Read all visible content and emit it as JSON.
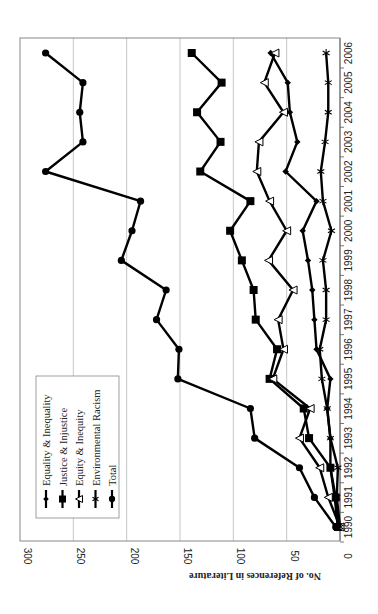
{
  "chart_data": {
    "type": "line",
    "orientation": "rotated-90-clockwise",
    "title": "",
    "xlabel": "",
    "ylabel": "No. of References in Literature",
    "ylim": [
      0,
      300
    ],
    "yticks": [
      0,
      50,
      100,
      150,
      200,
      250,
      300
    ],
    "grid": "horizontal",
    "legend_position": "upper-left (inside plot)",
    "x": [
      "1990",
      "1991",
      "1992",
      "1993",
      "1994",
      "1995",
      "1996",
      "1997",
      "1998",
      "1999",
      "2000",
      "2001",
      "2002",
      "2003",
      "2004",
      "2005",
      "2006"
    ],
    "series": [
      {
        "name": "Equality & Inequality",
        "marker": "diamond-filled",
        "values": [
          2,
          5,
          9,
          9,
          12,
          9,
          22,
          24,
          26,
          30,
          35,
          22,
          51,
          40,
          47,
          49,
          65
        ]
      },
      {
        "name": "Justice & Injustice",
        "marker": "square-filled",
        "values": [
          2,
          4,
          9,
          29,
          34,
          66,
          59,
          79,
          81,
          92,
          103,
          84,
          131,
          112,
          134,
          111,
          139
        ]
      },
      {
        "name": "Equity & Inequity",
        "marker": "triangle-open",
        "values": [
          0,
          11,
          19,
          38,
          28,
          63,
          53,
          58,
          44,
          67,
          50,
          66,
          78,
          76,
          53,
          71,
          61
        ]
      },
      {
        "name": "Environmental Racism",
        "marker": "star",
        "values": [
          0,
          3,
          2,
          9,
          12,
          17,
          19,
          13,
          13,
          16,
          8,
          16,
          18,
          14,
          11,
          11,
          13
        ]
      },
      {
        "name": "Total",
        "marker": "circle-filled",
        "values": [
          4,
          24,
          38,
          80,
          84,
          152,
          151,
          172,
          163,
          205,
          195,
          187,
          276,
          241,
          244,
          241,
          276
        ]
      }
    ]
  },
  "legend": {
    "items": [
      {
        "label": "Equality & Inequality"
      },
      {
        "label": "Justice & Injustice"
      },
      {
        "label": "Equity &  Inequity"
      },
      {
        "label": "Environmental Racism"
      },
      {
        "label": "Total"
      }
    ]
  },
  "colors": {
    "line": "#000000",
    "grid": "#b8b8b8",
    "frame": "#888888",
    "background": "#ffffff"
  }
}
